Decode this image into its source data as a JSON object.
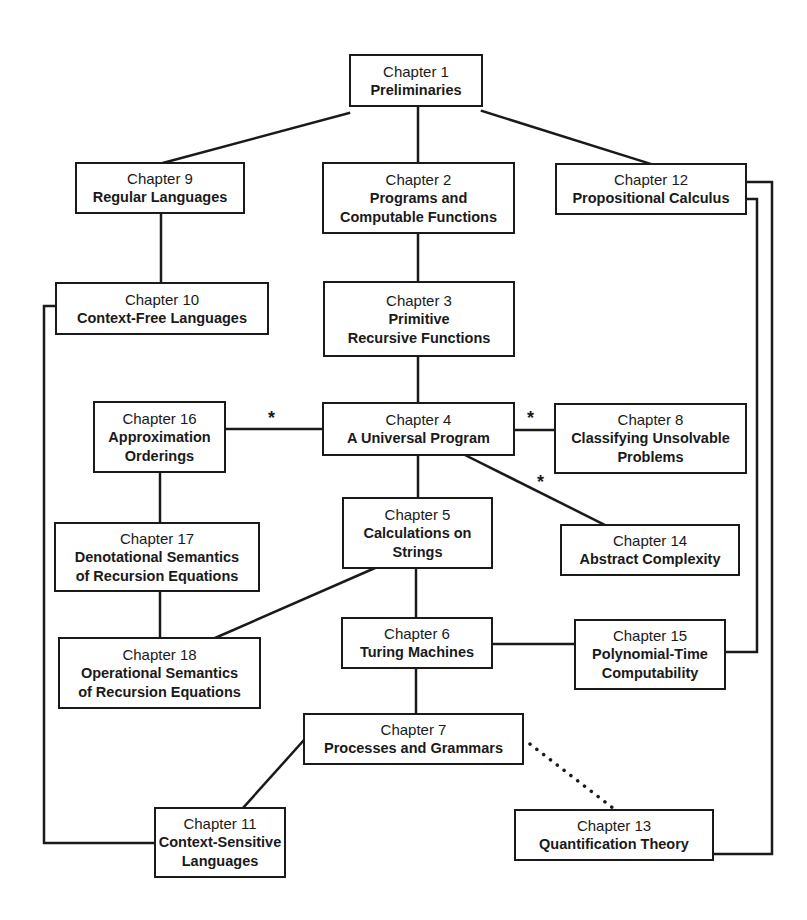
{
  "diagram": {
    "type": "chapter dependency graph",
    "chapters": [
      {
        "id": "ch1",
        "number": "Chapter 1",
        "title": "Preliminaries"
      },
      {
        "id": "ch2",
        "number": "Chapter 2",
        "title": "Programs and\nComputable Functions"
      },
      {
        "id": "ch3",
        "number": "Chapter 3",
        "title": "Primitive\nRecursive Functions"
      },
      {
        "id": "ch4",
        "number": "Chapter 4",
        "title": "A Universal Program"
      },
      {
        "id": "ch5",
        "number": "Chapter 5",
        "title": "Calculations on\nStrings"
      },
      {
        "id": "ch6",
        "number": "Chapter 6",
        "title": "Turing Machines"
      },
      {
        "id": "ch7",
        "number": "Chapter 7",
        "title": "Processes and Grammars"
      },
      {
        "id": "ch8",
        "number": "Chapter 8",
        "title": "Classifying Unsolvable\nProblems"
      },
      {
        "id": "ch9",
        "number": "Chapter 9",
        "title": "Regular Languages"
      },
      {
        "id": "ch10",
        "number": "Chapter 10",
        "title": "Context-Free Languages"
      },
      {
        "id": "ch11",
        "number": "Chapter 11",
        "title": "Context-Sensitive\nLanguages"
      },
      {
        "id": "ch12",
        "number": "Chapter 12",
        "title": "Propositional Calculus"
      },
      {
        "id": "ch13",
        "number": "Chapter 13",
        "title": "Quantification Theory"
      },
      {
        "id": "ch14",
        "number": "Chapter 14",
        "title": "Abstract Complexity"
      },
      {
        "id": "ch15",
        "number": "Chapter 15",
        "title": "Polynomial-Time\nComputability"
      },
      {
        "id": "ch16",
        "number": "Chapter 16",
        "title": "Approximation\nOrderings"
      },
      {
        "id": "ch17",
        "number": "Chapter 17",
        "title": "Denotational Semantics\nof Recursion Equations"
      },
      {
        "id": "ch18",
        "number": "Chapter 18",
        "title": "Operational Semantics\nof Recursion Equations"
      }
    ],
    "edges": [
      {
        "from": "ch1",
        "to": "ch9",
        "style": "solid"
      },
      {
        "from": "ch1",
        "to": "ch2",
        "style": "solid"
      },
      {
        "from": "ch1",
        "to": "ch12",
        "style": "solid"
      },
      {
        "from": "ch9",
        "to": "ch10",
        "style": "solid"
      },
      {
        "from": "ch2",
        "to": "ch3",
        "style": "solid"
      },
      {
        "from": "ch3",
        "to": "ch4",
        "style": "solid"
      },
      {
        "from": "ch4",
        "to": "ch16",
        "style": "solid",
        "marker": "*"
      },
      {
        "from": "ch4",
        "to": "ch8",
        "style": "solid",
        "marker": "*"
      },
      {
        "from": "ch4",
        "to": "ch14",
        "style": "solid",
        "marker": "*"
      },
      {
        "from": "ch4",
        "to": "ch5",
        "style": "solid"
      },
      {
        "from": "ch16",
        "to": "ch17",
        "style": "solid"
      },
      {
        "from": "ch17",
        "to": "ch18",
        "style": "solid"
      },
      {
        "from": "ch5",
        "to": "ch18",
        "style": "solid"
      },
      {
        "from": "ch5",
        "to": "ch6",
        "style": "solid"
      },
      {
        "from": "ch6",
        "to": "ch15",
        "style": "solid"
      },
      {
        "from": "ch6",
        "to": "ch7",
        "style": "solid"
      },
      {
        "from": "ch7",
        "to": "ch11",
        "style": "solid"
      },
      {
        "from": "ch7",
        "to": "ch13",
        "style": "dotted"
      },
      {
        "from": "ch10",
        "to": "ch11",
        "style": "solid"
      },
      {
        "from": "ch12",
        "to": "ch15",
        "style": "solid"
      },
      {
        "from": "ch12",
        "to": "ch13",
        "style": "solid"
      }
    ],
    "marker_symbol": "*",
    "colors": {
      "line": "#1a1a1a",
      "background": "#ffffff",
      "box_border": "#1a1a1a"
    }
  }
}
